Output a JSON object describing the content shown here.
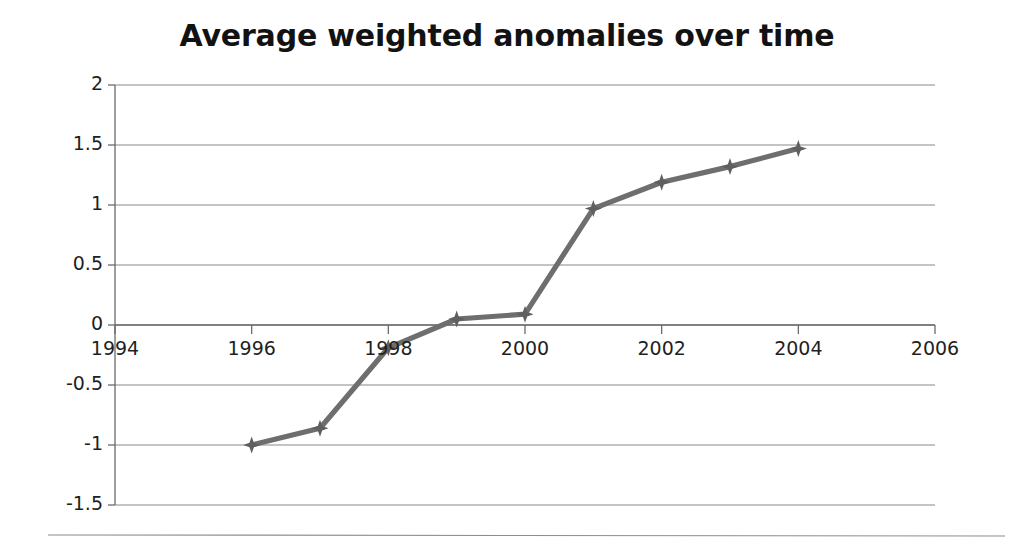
{
  "chart_data": {
    "type": "line",
    "title": "Average weighted anomalies over time",
    "xlabel": "",
    "ylabel": "",
    "x": [
      1996,
      1997,
      1998,
      1999,
      2000,
      2001,
      2002,
      2003,
      2004
    ],
    "values": [
      -1.0,
      -0.86,
      -0.19,
      0.05,
      0.09,
      0.97,
      1.19,
      1.32,
      1.47
    ],
    "series": [
      {
        "name": "Average weighted anomaly",
        "values": [
          -1.0,
          -0.86,
          -0.19,
          0.05,
          0.09,
          0.97,
          1.19,
          1.32,
          1.47
        ]
      }
    ],
    "xlim": [
      1994,
      2006
    ],
    "ylim": [
      -1.5,
      2
    ],
    "xticks": [
      1994,
      1996,
      1998,
      2000,
      2002,
      2004,
      2006
    ],
    "xtick_labels": [
      "1994",
      "1996",
      "1998",
      "2000",
      "2002",
      "2004",
      "2006"
    ],
    "yticks": [
      2,
      1.5,
      1,
      0.5,
      0,
      -0.5,
      -1,
      -1.5
    ],
    "ytick_labels": [
      "2",
      "1.5",
      "1",
      "0.5",
      "0",
      "-0.5",
      "-1",
      "-1.5"
    ],
    "grid": true,
    "grid_axis": "y",
    "legend": false,
    "legend_position": "none",
    "marker": "diamond",
    "line_color": "#6e6e6e",
    "marker_color": "#5f5f5f",
    "grid_color": "#8a8a8a",
    "axis_color": "#6b6b6b",
    "title_color": "#121212",
    "tick_label_color": "#1f1f1f",
    "background_color": "#ffffff"
  },
  "footer": {
    "divider_color": "#8d8d8d"
  }
}
